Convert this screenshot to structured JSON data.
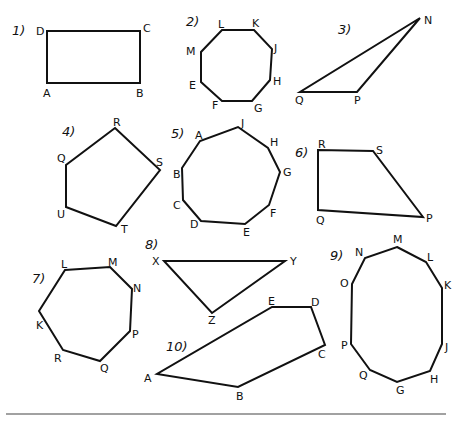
{
  "worksheet": {
    "colors": {
      "ink": "#111111",
      "background": "#ffffff",
      "rule": "#444444"
    },
    "figures": [
      {
        "number": "1)",
        "num_pos": [
          12,
          35
        ],
        "shape": "rectangle",
        "vertices": [
          {
            "label": "D",
            "x": 47,
            "y": 31,
            "lx": 36,
            "ly": 35
          },
          {
            "label": "C",
            "x": 140,
            "y": 31,
            "lx": 143,
            "ly": 32
          },
          {
            "label": "B",
            "x": 140,
            "y": 83,
            "lx": 136,
            "ly": 97
          },
          {
            "label": "A",
            "x": 47,
            "y": 83,
            "lx": 43,
            "ly": 97
          }
        ]
      },
      {
        "number": "2)",
        "num_pos": [
          186,
          26
        ],
        "shape": "octagon",
        "vertices": [
          {
            "label": "L",
            "x": 222,
            "y": 30,
            "lx": 218,
            "ly": 28
          },
          {
            "label": "K",
            "x": 254,
            "y": 30,
            "lx": 252,
            "ly": 27
          },
          {
            "label": "J",
            "x": 272,
            "y": 49,
            "lx": 274,
            "ly": 52
          },
          {
            "label": "H",
            "x": 270,
            "y": 80,
            "lx": 273,
            "ly": 85
          },
          {
            "label": "G",
            "x": 252,
            "y": 101,
            "lx": 254,
            "ly": 112
          },
          {
            "label": "F",
            "x": 222,
            "y": 101,
            "lx": 212,
            "ly": 109
          },
          {
            "label": "E",
            "x": 201,
            "y": 82,
            "lx": 189,
            "ly": 89
          },
          {
            "label": "M",
            "x": 201,
            "y": 52,
            "lx": 186,
            "ly": 55
          }
        ]
      },
      {
        "number": "3)",
        "num_pos": [
          338,
          34
        ],
        "shape": "triangle",
        "vertices": [
          {
            "label": "N",
            "x": 420,
            "y": 18,
            "lx": 424,
            "ly": 24
          },
          {
            "label": "P",
            "x": 357,
            "y": 92,
            "lx": 354,
            "ly": 104
          },
          {
            "label": "Q",
            "x": 300,
            "y": 92,
            "lx": 295,
            "ly": 104
          }
        ]
      },
      {
        "number": "4)",
        "num_pos": [
          62,
          136
        ],
        "shape": "pentagon",
        "vertices": [
          {
            "label": "R",
            "x": 115,
            "y": 128,
            "lx": 113,
            "ly": 126
          },
          {
            "label": "S",
            "x": 160,
            "y": 170,
            "lx": 156,
            "ly": 166
          },
          {
            "label": "T",
            "x": 116,
            "y": 226,
            "lx": 121,
            "ly": 233
          },
          {
            "label": "U",
            "x": 66,
            "y": 207,
            "lx": 57,
            "ly": 218
          },
          {
            "label": "Q",
            "x": 66,
            "y": 165,
            "lx": 57,
            "ly": 162
          }
        ]
      },
      {
        "number": "5)",
        "num_pos": [
          171,
          138
        ],
        "shape": "nonagon",
        "vertices": [
          {
            "label": "J",
            "x": 238,
            "y": 127,
            "lx": 241,
            "ly": 127
          },
          {
            "label": "H",
            "x": 268,
            "y": 148,
            "lx": 270,
            "ly": 146
          },
          {
            "label": "G",
            "x": 280,
            "y": 172,
            "lx": 283,
            "ly": 176
          },
          {
            "label": "F",
            "x": 269,
            "y": 205,
            "lx": 270,
            "ly": 217
          },
          {
            "label": "E",
            "x": 245,
            "y": 224,
            "lx": 243,
            "ly": 236
          },
          {
            "label": "D",
            "x": 201,
            "y": 221,
            "lx": 190,
            "ly": 228
          },
          {
            "label": "C",
            "x": 183,
            "y": 200,
            "lx": 173,
            "ly": 209
          },
          {
            "label": "B",
            "x": 182,
            "y": 168,
            "lx": 173,
            "ly": 178
          },
          {
            "label": "A",
            "x": 200,
            "y": 141,
            "lx": 195,
            "ly": 139
          }
        ]
      },
      {
        "number": "6)",
        "num_pos": [
          295,
          157
        ],
        "shape": "trapezoid",
        "vertices": [
          {
            "label": "R",
            "x": 318,
            "y": 150,
            "lx": 318,
            "ly": 148
          },
          {
            "label": "S",
            "x": 373,
            "y": 151,
            "lx": 376,
            "ly": 154
          },
          {
            "label": "P",
            "x": 423,
            "y": 217,
            "lx": 426,
            "ly": 222
          },
          {
            "label": "Q",
            "x": 318,
            "y": 210,
            "lx": 316,
            "ly": 224
          }
        ]
      },
      {
        "number": "7)",
        "num_pos": [
          32,
          283
        ],
        "shape": "heptagon",
        "vertices": [
          {
            "label": "L",
            "x": 65,
            "y": 270,
            "lx": 61,
            "ly": 268
          },
          {
            "label": "M",
            "x": 110,
            "y": 267,
            "lx": 108,
            "ly": 266
          },
          {
            "label": "N",
            "x": 132,
            "y": 289,
            "lx": 133,
            "ly": 292
          },
          {
            "label": "P",
            "x": 130,
            "y": 331,
            "lx": 132,
            "ly": 338
          },
          {
            "label": "Q",
            "x": 100,
            "y": 361,
            "lx": 100,
            "ly": 372
          },
          {
            "label": "R",
            "x": 63,
            "y": 350,
            "lx": 54,
            "ly": 362
          },
          {
            "label": "K",
            "x": 39,
            "y": 311,
            "lx": 36,
            "ly": 329
          }
        ]
      },
      {
        "number": "8)",
        "num_pos": [
          145,
          249
        ],
        "shape": "triangle",
        "vertices": [
          {
            "label": "X",
            "x": 164,
            "y": 261,
            "lx": 152,
            "ly": 265
          },
          {
            "label": "Y",
            "x": 285,
            "y": 261,
            "lx": 290,
            "ly": 265
          },
          {
            "label": "Z",
            "x": 212,
            "y": 313,
            "lx": 208,
            "ly": 324
          }
        ]
      },
      {
        "number": "9)",
        "num_pos": [
          330,
          260
        ],
        "shape": "decagon",
        "vertices": [
          {
            "label": "M",
            "x": 397,
            "y": 247,
            "lx": 393,
            "ly": 243
          },
          {
            "label": "L",
            "x": 426,
            "y": 262,
            "lx": 427,
            "ly": 261
          },
          {
            "label": "K",
            "x": 442,
            "y": 288,
            "lx": 444,
            "ly": 289
          },
          {
            "label": "J",
            "x": 442,
            "y": 344,
            "lx": 445,
            "ly": 351
          },
          {
            "label": "H",
            "x": 430,
            "y": 371,
            "lx": 430,
            "ly": 383
          },
          {
            "label": "G",
            "x": 397,
            "y": 382,
            "lx": 396,
            "ly": 394
          },
          {
            "label": "Q",
            "x": 370,
            "y": 370,
            "lx": 359,
            "ly": 379
          },
          {
            "label": "P",
            "x": 351,
            "y": 344,
            "lx": 341,
            "ly": 349
          },
          {
            "label": "O",
            "x": 352,
            "y": 284,
            "lx": 340,
            "ly": 287
          },
          {
            "label": "N",
            "x": 365,
            "y": 258,
            "lx": 355,
            "ly": 256
          }
        ]
      },
      {
        "number": "10)",
        "num_pos": [
          166,
          351
        ],
        "shape": "pentagon",
        "vertices": [
          {
            "label": "E",
            "x": 272,
            "y": 307,
            "lx": 268,
            "ly": 305
          },
          {
            "label": "D",
            "x": 311,
            "y": 307,
            "lx": 311,
            "ly": 306
          },
          {
            "label": "C",
            "x": 325,
            "y": 345,
            "lx": 318,
            "ly": 358
          },
          {
            "label": "B",
            "x": 238,
            "y": 387,
            "lx": 236,
            "ly": 400
          },
          {
            "label": "A",
            "x": 157,
            "y": 374,
            "lx": 144,
            "ly": 382
          }
        ]
      }
    ],
    "bottom_rule": {
      "x1": 6,
      "x2": 446,
      "y": 414
    }
  }
}
